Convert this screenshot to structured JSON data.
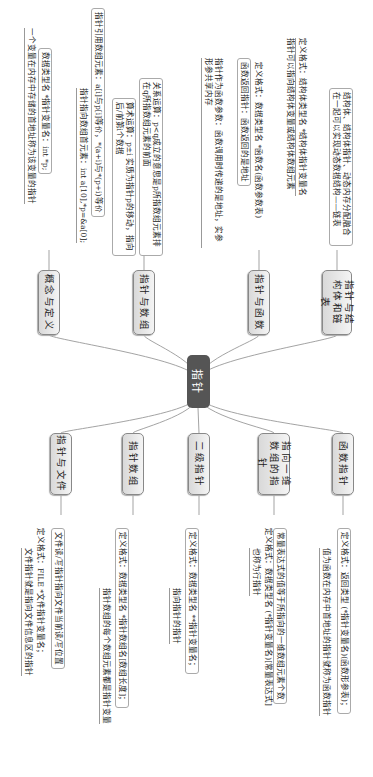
{
  "center": {
    "label": "指针",
    "color": "#555555"
  },
  "branches_right": [
    {
      "label": "概念与定义",
      "leaves": [
        "一个变量在内存中存储的首地址称为该变量的指针",
        "数据类型名 *指针变量名：int *p;"
      ]
    },
    {
      "label": "指针与数组",
      "leaves": [
        "指针指向数组首元素：int a[10],*p=&a[0];",
        "指针引用数组元素：a[i]与p[i]等价，*(a+i)与*(p+i)等价",
        "算术运算：p±i 实质为指针p的移动，指向后/前第i个数据",
        "关系运算：p<q成立的意思是p所指数组元素排在q所指数组元素的前面"
      ]
    },
    {
      "label": "指针与函数",
      "leaves": [
        "指针作为函数参数：函数调用时传递的是地址，实参形参共享内存",
        "函数返回指针：函数返回的是地址",
        "定义格式：数据类型名 *函数名(函数参数表)"
      ]
    },
    {
      "label": "指针与结构体和链表",
      "leaves": [
        "指针可以指向结构体变量或结构体数组元素",
        "定义格式：结构体类型名 *结构体指针变量名",
        "结构体、结构体指针、动态内存分配融合在一起可以实现动态数据结构——链表"
      ]
    }
  ],
  "branches_left": [
    {
      "label": "指针与文件",
      "leaves": [
        "文件指针就是指向文件信息区的指针",
        "定义格式：FILE *文件指针变量名；",
        "文件读/写指针指向文件当前读/写位置"
      ]
    },
    {
      "label": "指针数组",
      "leaves": [
        "指针数组的每个数组元素都是指针变量",
        "定义格式：数据类型名 *指针数组名[数组长度]；"
      ]
    },
    {
      "label": "二级指针",
      "leaves": [
        "指向指针的指针",
        "定义格式：数据类型名 **指针变量名；"
      ]
    },
    {
      "label": "指向一维数组的指针",
      "leaves": [
        "也称为行指针",
        "定义格式：数据类型名 (*指针变量名)[常量表达式]",
        "常量表达式的值等于所指向的一维数组元素个数"
      ]
    },
    {
      "label": "函数指针",
      "leaves": [
        "值为函数在内存中首地址的指针就称为函数指针",
        "定义格式：返回类型 (*指针变量名)(函数形参表)；"
      ]
    }
  ]
}
